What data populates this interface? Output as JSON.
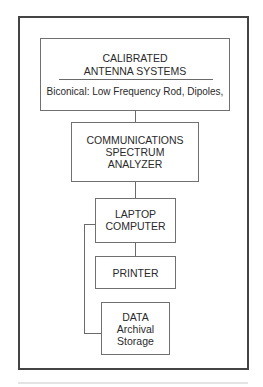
{
  "diagram": {
    "type": "block-diagram",
    "boxes": {
      "antenna": {
        "title_line1": "CALIBRATED",
        "title_line2": "ANTENNA SYSTEMS",
        "detail": "Biconical: Low Frequency Rod, Dipoles,"
      },
      "analyzer": {
        "line1": "COMMUNICATIONS",
        "line2": "SPECTRUM",
        "line3": "ANALYZER"
      },
      "laptop": {
        "line1": "LAPTOP",
        "line2": "COMPUTER"
      },
      "printer": {
        "line1": "PRINTER"
      },
      "storage": {
        "line1": "DATA",
        "line2": "Archival",
        "line3": "Storage"
      }
    },
    "connections": [
      {
        "from": "antenna",
        "to": "analyzer"
      },
      {
        "from": "analyzer",
        "to": "laptop"
      },
      {
        "from": "laptop",
        "to": "printer"
      },
      {
        "from": "laptop",
        "to": "storage"
      }
    ]
  }
}
